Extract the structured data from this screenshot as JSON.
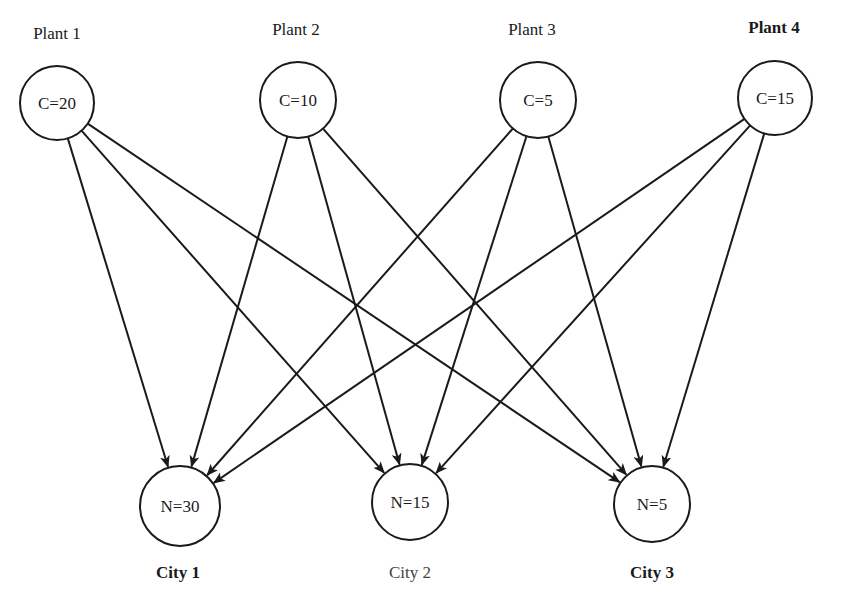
{
  "diagram": {
    "type": "bipartite-network",
    "plants": [
      {
        "label": "Plant 1",
        "capacity": "C=20",
        "cx": 57,
        "cy": 103,
        "r": 37,
        "lx": 57,
        "ly": 24,
        "bold": false
      },
      {
        "label": "Plant 2",
        "capacity": "C=10",
        "cx": 298,
        "cy": 100,
        "r": 38,
        "lx": 296,
        "ly": 20,
        "bold": false
      },
      {
        "label": "Plant 3",
        "capacity": "C=5",
        "cx": 538,
        "cy": 100,
        "r": 38,
        "lx": 532,
        "ly": 20,
        "bold": false
      },
      {
        "label": "Plant 4",
        "capacity": "C=15",
        "cx": 775,
        "cy": 98,
        "r": 37,
        "lx": 774,
        "ly": 18,
        "bold": true
      }
    ],
    "cities": [
      {
        "label": "City 1",
        "demand": "N=30",
        "cx": 180,
        "cy": 506,
        "r": 40,
        "lx": 178,
        "ly": 563,
        "bold": true
      },
      {
        "label": "City 2",
        "demand": "N=15",
        "cx": 410,
        "cy": 502,
        "r": 38,
        "lx": 410,
        "ly": 563,
        "bold": false
      },
      {
        "label": "City 3",
        "demand": "N=5",
        "cx": 652,
        "cy": 504,
        "r": 38,
        "lx": 652,
        "ly": 563,
        "bold": true
      }
    ],
    "edges": [
      {
        "from": 0,
        "to": 0
      },
      {
        "from": 0,
        "to": 1
      },
      {
        "from": 0,
        "to": 2
      },
      {
        "from": 1,
        "to": 0
      },
      {
        "from": 1,
        "to": 1
      },
      {
        "from": 1,
        "to": 2
      },
      {
        "from": 2,
        "to": 0
      },
      {
        "from": 2,
        "to": 1
      },
      {
        "from": 2,
        "to": 2
      },
      {
        "from": 3,
        "to": 0
      },
      {
        "from": 3,
        "to": 1
      },
      {
        "from": 3,
        "to": 2
      }
    ],
    "stroke_color": "#1a1a1a"
  }
}
